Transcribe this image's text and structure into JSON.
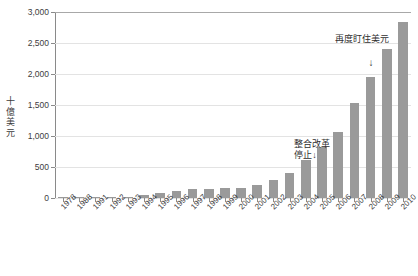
{
  "chart_data": {
    "type": "bar",
    "title": "",
    "subtitle": "",
    "xlabel": "",
    "ylabel": "十億美元",
    "ylim": [
      0,
      3000
    ],
    "ytick_values": [
      0,
      500,
      1000,
      1500,
      2000,
      2500,
      3000
    ],
    "ytick_labels": [
      "0",
      "500",
      "1,000",
      "1,500",
      "2,000",
      "2,500",
      "3,000"
    ],
    "grid": "horizontal",
    "legend": "none",
    "bar_color": "#9a9a9a",
    "categories": [
      "1978",
      "1988",
      "1991",
      "1992",
      "1993",
      "1994",
      "1995",
      "1996",
      "1997",
      "1998",
      "1999",
      "2000",
      "2001",
      "2002",
      "2003",
      "2004",
      "2005",
      "2006",
      "2007",
      "2008",
      "2009",
      "2010"
    ],
    "values": [
      2,
      18,
      22,
      20,
      21,
      52,
      74,
      107,
      140,
      145,
      155,
      166,
      212,
      286,
      403,
      610,
      819,
      1066,
      1528,
      1946,
      2399,
      2847
    ],
    "annotations": [
      {
        "name": "integration-reform-halt",
        "text_line1": "整合改革",
        "text_line2": "停止",
        "arrow": "↓",
        "points_at_category": "2006"
      },
      {
        "name": "repeg-to-usd",
        "text_line1": "再度盯住美元",
        "text_line2": "",
        "arrow": "↓",
        "points_at_category": "2008"
      }
    ]
  },
  "axis": {
    "y_title": "十億美元"
  }
}
